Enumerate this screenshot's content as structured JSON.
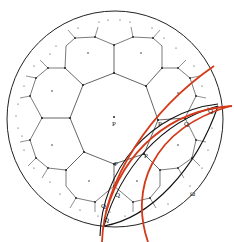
{
  "diagram": {
    "type": "hyperbolic-tiling",
    "labels": {
      "center": "P",
      "boundary": "Ω",
      "q_points": [
        "Q",
        "Q",
        "Q",
        "Q",
        "Q"
      ],
      "other": [
        "P",
        "P",
        "P"
      ]
    },
    "colors": {
      "ink": "#222222",
      "accent_arc": "#d43a1a",
      "background": "#ffffff"
    }
  }
}
